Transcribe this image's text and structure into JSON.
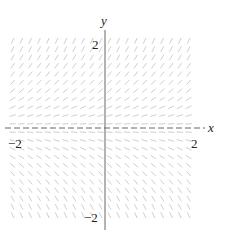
{
  "figure": {
    "type": "slope-field",
    "equation": "dy/dx = y",
    "axis_labels": {
      "x": "x",
      "y": "y"
    },
    "ticks": {
      "x": [
        {
          "value": -2,
          "label": "−2"
        },
        {
          "value": 2,
          "label": "2"
        }
      ],
      "y": [
        {
          "value": 2,
          "label": "2"
        },
        {
          "value": -2,
          "label": "−2"
        }
      ]
    },
    "range": {
      "x": [
        -2.2,
        2.2
      ],
      "y": [
        -2.1,
        2.1
      ]
    },
    "grid": {
      "cols": 21,
      "rows": 21
    },
    "colors": {
      "segment": "#c8c8c8",
      "axis": "#555555",
      "label": "#222222"
    }
  }
}
